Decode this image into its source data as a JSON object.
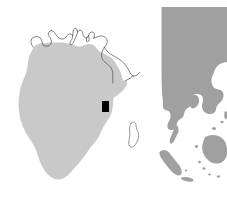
{
  "figure": {
    "title": "",
    "width": 227,
    "height": 200,
    "background_color": "#ffffff",
    "panels": [
      {
        "name": "africa-panel",
        "region_label": "Africa",
        "fill_color": "#c9c9c9",
        "outline_color": "#4a4a4a",
        "outline_width": 0.7,
        "bounds": [
          0,
          0,
          150,
          200
        ]
      },
      {
        "name": "asia-panel",
        "region_label": "Southeast Asia",
        "fill_color": "#a0a0a0",
        "bounds": [
          155,
          0,
          227,
          200
        ]
      }
    ]
  },
  "chart_data": {
    "type": "map",
    "title": "",
    "subtitle": "",
    "xlabel": "",
    "ylabel": "",
    "legend": [],
    "layers": [
      {
        "name": "africa-landmass",
        "label": "Africa",
        "style": "filled",
        "fill": "#c9c9c9",
        "stroke": "none"
      },
      {
        "name": "europe-mediterranean-coastline",
        "label": "Europe / Mediterranean coastline",
        "style": "outline",
        "fill": "none",
        "stroke": "#4a4a4a"
      },
      {
        "name": "middle-east-coastline",
        "label": "Middle East / Arabia coastline",
        "style": "outline",
        "fill": "none",
        "stroke": "#4a4a4a"
      },
      {
        "name": "madagascar-outline",
        "label": "Madagascar",
        "style": "outline",
        "fill": "none",
        "stroke": "#6a6a6a"
      },
      {
        "name": "southeast-asia-landmass",
        "label": "Southeast Asia",
        "style": "filled",
        "fill": "#a0a0a0",
        "stroke": "none"
      }
    ],
    "markers": [
      {
        "name": "study-site-marker",
        "label": "",
        "shape": "rect",
        "color": "#000000",
        "x": 102,
        "y": 101,
        "width": 7,
        "height": 11
      }
    ],
    "colors": {
      "africa_fill": "#c9c9c9",
      "asia_fill": "#a0a0a0",
      "coastline_stroke": "#4a4a4a",
      "marker": "#000000",
      "background": "#ffffff"
    }
  }
}
